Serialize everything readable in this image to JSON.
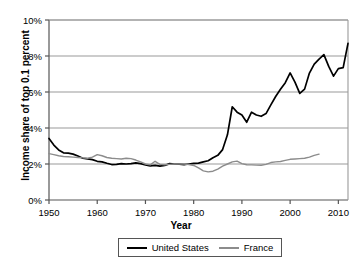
{
  "chart_data": {
    "type": "line",
    "title": "",
    "xlabel": "Year",
    "ylabel": "Income share of top 0.1 percent",
    "xlim": [
      1950,
      2012
    ],
    "ylim": [
      0,
      10
    ],
    "grid": "horizontal",
    "legend_position": "bottom",
    "x_ticks": [
      1950,
      1960,
      1970,
      1980,
      1990,
      2000,
      2010
    ],
    "x_tick_labels": [
      "1950",
      "1960",
      "1970",
      "1980",
      "1990",
      "2000",
      "2010"
    ],
    "y_ticks": [
      0,
      2,
      4,
      6,
      8,
      10
    ],
    "y_tick_labels": [
      "0%",
      "2%",
      "4%",
      "6%",
      "8%",
      "10%"
    ],
    "series": [
      {
        "name": "United States",
        "color": "#000000",
        "x": [
          1950,
          1951,
          1952,
          1953,
          1954,
          1955,
          1956,
          1957,
          1958,
          1959,
          1960,
          1961,
          1962,
          1963,
          1964,
          1965,
          1966,
          1967,
          1968,
          1969,
          1970,
          1971,
          1972,
          1973,
          1974,
          1975,
          1976,
          1977,
          1978,
          1979,
          1980,
          1981,
          1982,
          1983,
          1984,
          1985,
          1986,
          1987,
          1988,
          1989,
          1990,
          1991,
          1992,
          1993,
          1994,
          1995,
          1996,
          1997,
          1998,
          1999,
          2000,
          2001,
          2002,
          2003,
          2004,
          2005,
          2006,
          2007,
          2008,
          2009,
          2010,
          2011,
          2012
        ],
        "values": [
          3.42,
          3.05,
          2.78,
          2.62,
          2.6,
          2.55,
          2.44,
          2.32,
          2.28,
          2.24,
          2.15,
          2.12,
          2.04,
          1.97,
          1.98,
          2.02,
          2.0,
          2.02,
          2.06,
          2.02,
          1.95,
          1.9,
          1.92,
          1.88,
          1.92,
          2.02,
          2.0,
          1.99,
          1.97,
          2.0,
          2.03,
          2.05,
          2.12,
          2.18,
          2.35,
          2.48,
          2.8,
          3.62,
          5.18,
          4.88,
          4.72,
          4.32,
          4.88,
          4.72,
          4.65,
          4.8,
          5.28,
          5.75,
          6.15,
          6.52,
          7.06,
          6.55,
          5.92,
          6.16,
          7.05,
          7.55,
          7.83,
          8.08,
          7.42,
          6.88,
          7.3,
          7.35,
          8.7
        ]
      },
      {
        "name": "France",
        "color": "#8c8c8c",
        "x": [
          1950,
          1951,
          1952,
          1953,
          1954,
          1955,
          1956,
          1957,
          1958,
          1959,
          1960,
          1961,
          1962,
          1963,
          1964,
          1965,
          1966,
          1967,
          1968,
          1969,
          1970,
          1971,
          1972,
          1973,
          1974,
          1975,
          1976,
          1977,
          1978,
          1979,
          1980,
          1981,
          1982,
          1983,
          1984,
          1985,
          1986,
          1987,
          1988,
          1989,
          1990,
          1991,
          1992,
          1993,
          1994,
          1995,
          1996,
          1997,
          1998,
          1999,
          2000,
          2001,
          2002,
          2003,
          2004,
          2005,
          2006
        ],
        "values": [
          2.58,
          2.52,
          2.46,
          2.42,
          2.4,
          2.38,
          2.36,
          2.34,
          2.32,
          2.38,
          2.52,
          2.46,
          2.36,
          2.32,
          2.3,
          2.28,
          2.32,
          2.3,
          2.22,
          2.12,
          2.0,
          1.95,
          2.15,
          1.98,
          1.96,
          1.98,
          2.0,
          2.0,
          2.0,
          1.97,
          1.92,
          1.78,
          1.62,
          1.56,
          1.6,
          1.72,
          1.88,
          2.0,
          2.12,
          2.16,
          2.02,
          1.96,
          1.95,
          1.94,
          1.93,
          1.98,
          2.08,
          2.12,
          2.14,
          2.2,
          2.26,
          2.28,
          2.3,
          2.32,
          2.38,
          2.48,
          2.55
        ]
      }
    ]
  }
}
